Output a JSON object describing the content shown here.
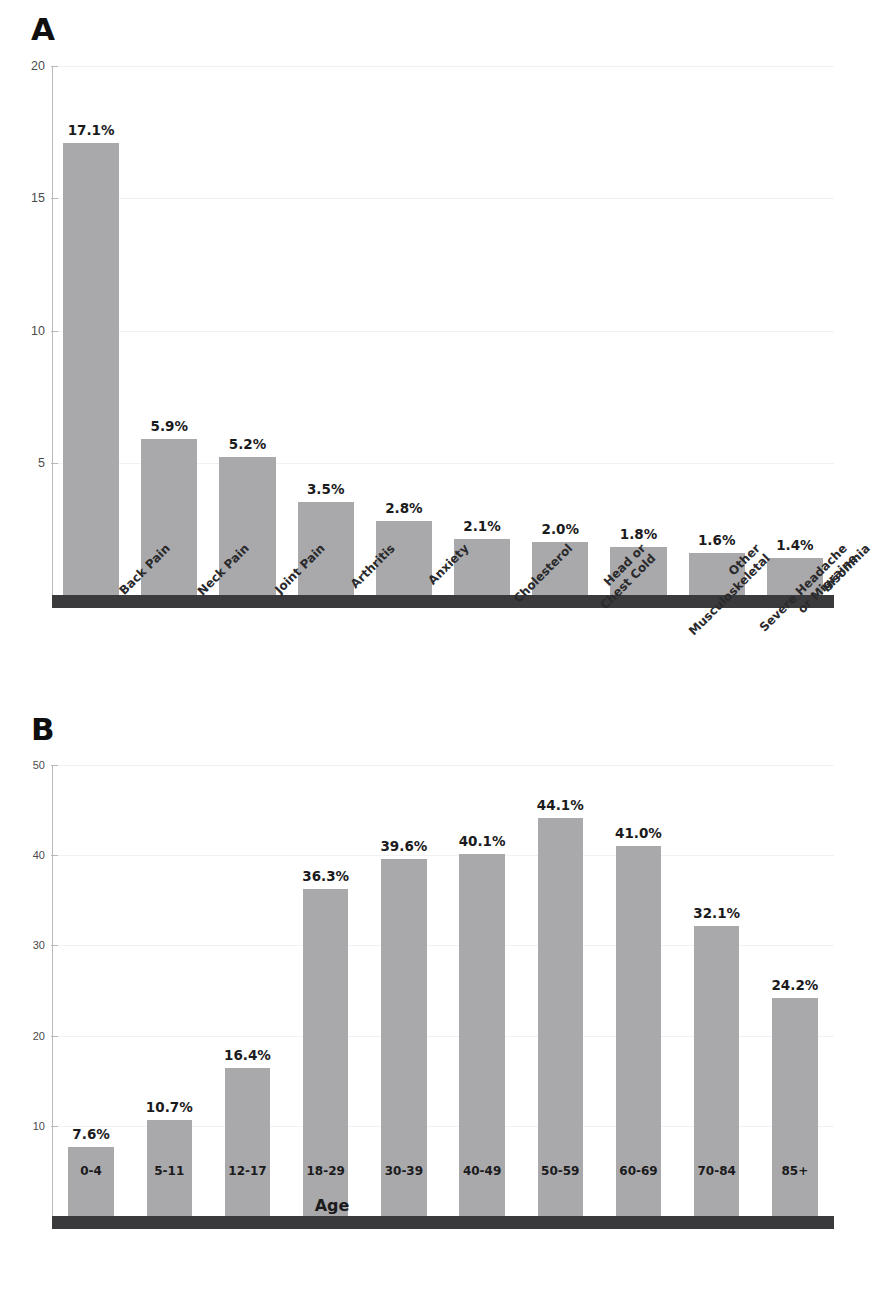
{
  "figure": {
    "panel_a_letter": "A",
    "panel_b_letter": "B"
  },
  "chart_data": [
    {
      "id": "panel-a",
      "type": "bar",
      "panel_label": "A",
      "title": "",
      "xlabel": "",
      "ylabel": "",
      "ylim": [
        0,
        20
      ],
      "yticks": [
        5,
        10,
        15,
        20
      ],
      "ytick_labels": [
        "5",
        "10",
        "15",
        "20"
      ],
      "grid": true,
      "legend": "none",
      "bar_color": "#a9a9ab",
      "baseline_color": "#3a3a3c",
      "categories": [
        "Back Pain",
        "Neck Pain",
        "Joint Pain",
        "Arthritis",
        "Anxiety",
        "Cholesterol",
        "Head or\nChest Cold",
        "Other\nMusculoskeletal",
        "Severe Headache\nor Migraine",
        "Insomnia"
      ],
      "category_lines": [
        [
          "Back Pain"
        ],
        [
          "Neck Pain"
        ],
        [
          "Joint Pain"
        ],
        [
          "Arthritis"
        ],
        [
          "Anxiety"
        ],
        [
          "Cholesterol"
        ],
        [
          "Head or",
          "Chest Cold"
        ],
        [
          "Other",
          "Musculoskeletal"
        ],
        [
          "Severe Headache",
          "or Migraine"
        ],
        [
          "Insomnia"
        ]
      ],
      "values": [
        17.1,
        5.9,
        5.2,
        3.5,
        2.8,
        2.1,
        2.0,
        1.8,
        1.6,
        1.4
      ],
      "value_labels": [
        "17.1%",
        "5.9%",
        "5.2%",
        "3.5%",
        "2.8%",
        "2.1%",
        "2.0%",
        "1.8%",
        "1.6%",
        "1.4%"
      ]
    },
    {
      "id": "panel-b",
      "type": "bar",
      "panel_label": "B",
      "title": "",
      "xlabel": "Age",
      "ylabel": "",
      "ylim": [
        0,
        50
      ],
      "yticks": [
        10,
        20,
        30,
        40,
        50
      ],
      "ytick_labels": [
        "10",
        "20",
        "30",
        "40",
        "50"
      ],
      "grid": true,
      "legend": "none",
      "bar_color": "#a9a9ab",
      "baseline_color": "#3a3a3c",
      "categories": [
        "0-4",
        "5-11",
        "12-17",
        "18-29",
        "30-39",
        "40-49",
        "50-59",
        "60-69",
        "70-84",
        "85+"
      ],
      "values": [
        7.6,
        10.7,
        16.4,
        36.3,
        39.6,
        40.1,
        44.1,
        41.0,
        32.1,
        24.2
      ],
      "value_labels": [
        "7.6%",
        "10.7%",
        "16.4%",
        "36.3%",
        "39.6%",
        "40.1%",
        "44.1%",
        "41.0%",
        "32.1%",
        "24.2%"
      ]
    }
  ]
}
